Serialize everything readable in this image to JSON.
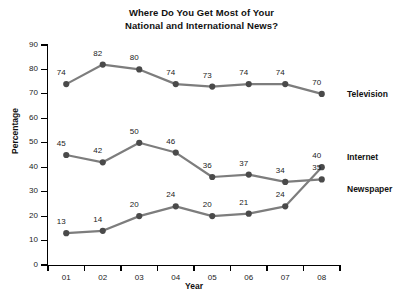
{
  "chart_data": {
    "type": "line",
    "title": "Where Do You Get Most of Your National and International News?",
    "title_line1": "Where Do You Get Most of Your",
    "title_line2": "National and International News?",
    "xlabel": "Year",
    "ylabel": "Percentage",
    "categories": [
      "01",
      "02",
      "03",
      "04",
      "05",
      "06",
      "07",
      "08"
    ],
    "ylim": [
      0,
      90
    ],
    "ytick_step": 10,
    "yticks": [
      0,
      10,
      20,
      30,
      40,
      50,
      60,
      70,
      80,
      90
    ],
    "grid": false,
    "legend_position": "right-inline",
    "series": [
      {
        "name": "Television",
        "values": [
          74,
          82,
          80,
          74,
          73,
          74,
          74,
          70
        ],
        "color": "#7d7d7d",
        "marker_color": "#4a4a4a"
      },
      {
        "name": "Newspaper",
        "values": [
          45,
          42,
          50,
          46,
          36,
          37,
          34,
          35
        ],
        "color": "#7d7d7d",
        "marker_color": "#4a4a4a"
      },
      {
        "name": "Internet",
        "values": [
          13,
          14,
          20,
          24,
          20,
          21,
          24,
          40
        ],
        "color": "#7d7d7d",
        "marker_color": "#4a4a4a"
      }
    ]
  },
  "colors": {
    "background": "#ffffff",
    "axis": "#000000",
    "line": "#7d7d7d",
    "marker": "#4a4a4a",
    "text": "#111111"
  }
}
